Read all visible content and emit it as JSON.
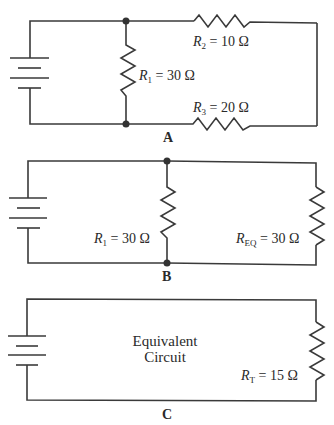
{
  "circuits": [
    {
      "panel_label": "A",
      "resistors": [
        {
          "name": "R",
          "sub": "1",
          "value": "= 30 Ω"
        },
        {
          "name": "R",
          "sub": "2",
          "value": "= 10 Ω"
        },
        {
          "name": "R",
          "sub": "3",
          "value": "= 20 Ω"
        }
      ]
    },
    {
      "panel_label": "B",
      "resistors": [
        {
          "name": "R",
          "sub": "1",
          "value": "= 30 Ω"
        },
        {
          "name": "R",
          "sub": "EQ",
          "value": "= 30 Ω"
        }
      ]
    },
    {
      "panel_label": "C",
      "caption_line1": "Equivalent",
      "caption_line2": "Circuit",
      "resistors": [
        {
          "name": "R",
          "sub": "T",
          "value": "= 15 Ω"
        }
      ]
    }
  ],
  "colors": {
    "wire": "#3a3a3a",
    "background": "#ffffff"
  }
}
